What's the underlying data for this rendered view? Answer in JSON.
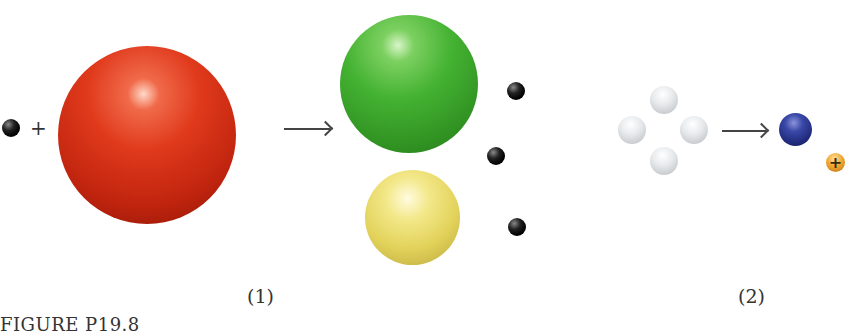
{
  "figure": {
    "caption": "FIGURE P19.8",
    "panel1_label": "(1)",
    "panel2_label": "(2)",
    "plus_sign": "+",
    "positron_symbol": "+"
  },
  "panel1": {
    "reactants": [
      "neutron",
      "large-nucleus"
    ],
    "products": [
      "fission-fragment-green",
      "fission-fragment-yellow",
      "neutron",
      "neutron",
      "neutron"
    ],
    "colors": {
      "large_nucleus": "#d8321a",
      "green_fragment": "#3cae2c",
      "yellow_fragment": "#e6d656",
      "neutron": "#111111"
    }
  },
  "panel2": {
    "reactants": [
      "proton",
      "proton",
      "proton",
      "proton"
    ],
    "products": [
      "helium-nucleus",
      "positron"
    ],
    "colors": {
      "proton": "#e8eaec",
      "helium_nucleus": "#1f2a7a",
      "positron": "#e0901c"
    }
  }
}
